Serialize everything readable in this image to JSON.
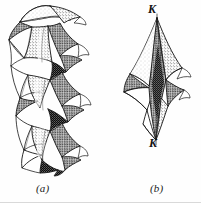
{
  "figure": {
    "type": "scientific-line-illustration",
    "technique": "pen-and-ink stipple engraving",
    "background_color": "#fefefe",
    "ink_color": "#1a1a1a",
    "stipple_color": "#2a2a2a",
    "panels": [
      {
        "id": "a",
        "caption": "(a)",
        "description": "Elongate vertical chain of three repeating flared winged segments, each with outward-projecting spinose flanges, stippled shading on the right of each segment",
        "segment_count": 3,
        "orientation": "vertical",
        "bbox": {
          "x": 8,
          "y": 4,
          "width": 78,
          "height": 170
        }
      },
      {
        "id": "b",
        "caption": "(b)",
        "description": "Single biconical spindle-shaped body with four radiating wing-like flanges, tapering to sharp apices at top and bottom, marked K at each apex",
        "segment_count": 1,
        "orientation": "vertical",
        "bbox": {
          "x": 122,
          "y": 14,
          "width": 70,
          "height": 132
        }
      }
    ],
    "annotations": [
      {
        "id": "k-top",
        "text": "K",
        "panel": "b",
        "position": "apical",
        "x": 153,
        "y": 10
      },
      {
        "id": "k-bottom",
        "text": "K",
        "panel": "b",
        "position": "basal",
        "x": 154,
        "y": 144
      }
    ],
    "captions": {
      "panel_a": "(a)",
      "panel_b": "(b)"
    }
  }
}
